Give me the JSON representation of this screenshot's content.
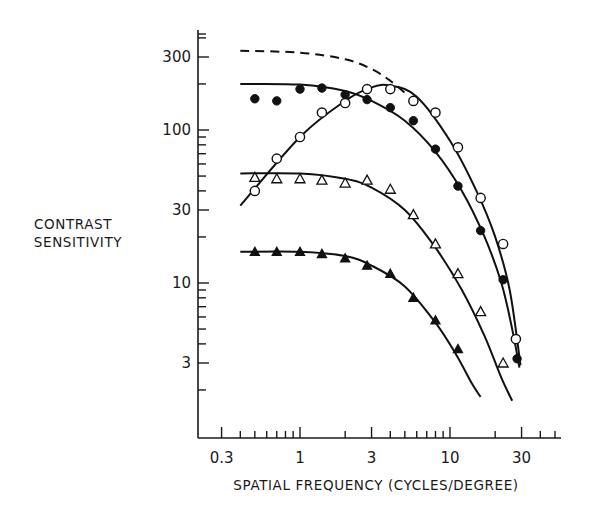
{
  "chart_data": {
    "type": "line",
    "title": "",
    "xlabel": "SPATIAL FREQUENCY (CYCLES/DEGREE)",
    "ylabel": [
      "CONTRAST",
      "SENSITIVITY"
    ],
    "xscale": "log",
    "yscale": "log",
    "xlim": [
      0.25,
      40
    ],
    "ylim": [
      1.6,
      450
    ],
    "xticks": [
      0.3,
      1,
      3,
      10,
      30
    ],
    "xtick_labels": [
      "0.3",
      "1",
      "3",
      "10",
      "30"
    ],
    "yticks": [
      3,
      10,
      30,
      100,
      300
    ],
    "ytick_labels": [
      "3",
      "10",
      "30",
      "100",
      "300"
    ],
    "grid": false,
    "legend": null,
    "series": [
      {
        "name": "dashed envelope",
        "marker": "none",
        "line": "dashed",
        "curve": [
          [
            0.4,
            330
          ],
          [
            1,
            320
          ],
          [
            2,
            290
          ],
          [
            3,
            250
          ],
          [
            4,
            210
          ],
          [
            5,
            175
          ]
        ]
      },
      {
        "name": "filled circles",
        "marker": "filled-circle",
        "points": [
          [
            0.5,
            160
          ],
          [
            0.7,
            155
          ],
          [
            1,
            185
          ],
          [
            1.4,
            188
          ],
          [
            2,
            170
          ],
          [
            2.8,
            158
          ],
          [
            4,
            140
          ],
          [
            5.7,
            115
          ],
          [
            8,
            75
          ],
          [
            11.3,
            43
          ],
          [
            16,
            22
          ],
          [
            22.6,
            10.5
          ],
          [
            28,
            3.2
          ]
        ],
        "curve": [
          [
            0.4,
            200
          ],
          [
            1,
            198
          ],
          [
            2,
            180
          ],
          [
            3,
            155
          ],
          [
            5,
            115
          ],
          [
            8,
            72
          ],
          [
            12,
            40
          ],
          [
            17,
            20
          ],
          [
            22,
            10
          ],
          [
            26,
            5
          ],
          [
            29,
            2.8
          ]
        ]
      },
      {
        "name": "open circles",
        "marker": "open-circle",
        "points": [
          [
            0.5,
            40
          ],
          [
            0.7,
            65
          ],
          [
            1,
            90
          ],
          [
            1.4,
            130
          ],
          [
            2,
            150
          ],
          [
            2.8,
            185
          ],
          [
            4,
            185
          ],
          [
            5.7,
            155
          ],
          [
            8,
            130
          ],
          [
            11.3,
            77
          ],
          [
            16,
            36
          ],
          [
            22.6,
            18
          ],
          [
            27.5,
            4.3
          ]
        ],
        "curve": [
          [
            0.4,
            32
          ],
          [
            1,
            90
          ],
          [
            2,
            155
          ],
          [
            3,
            190
          ],
          [
            4,
            195
          ],
          [
            6,
            165
          ],
          [
            10,
            85
          ],
          [
            15,
            40
          ],
          [
            20,
            20
          ],
          [
            25,
            9
          ],
          [
            29.5,
            2.9
          ]
        ]
      },
      {
        "name": "open triangles",
        "marker": "open-triangle",
        "points": [
          [
            0.5,
            49
          ],
          [
            0.7,
            48
          ],
          [
            1,
            48
          ],
          [
            1.4,
            47
          ],
          [
            2,
            45
          ],
          [
            2.8,
            47
          ],
          [
            4,
            41
          ],
          [
            5.7,
            28
          ],
          [
            8,
            18
          ],
          [
            11.3,
            11.5
          ],
          [
            16,
            6.5
          ],
          [
            22.6,
            3
          ]
        ],
        "curve": [
          [
            0.4,
            52
          ],
          [
            1,
            52
          ],
          [
            2,
            48
          ],
          [
            3,
            42
          ],
          [
            5,
            30
          ],
          [
            8,
            17
          ],
          [
            12,
            9
          ],
          [
            17,
            4.5
          ],
          [
            22,
            2.4
          ],
          [
            26,
            1.7
          ]
        ]
      },
      {
        "name": "filled triangles",
        "marker": "filled-triangle",
        "points": [
          [
            0.5,
            16
          ],
          [
            0.7,
            16
          ],
          [
            1,
            16
          ],
          [
            1.4,
            15.5
          ],
          [
            2,
            14.5
          ],
          [
            2.8,
            13
          ],
          [
            4,
            11.5
          ],
          [
            5.7,
            8
          ],
          [
            8,
            5.7
          ],
          [
            11.3,
            3.7
          ]
        ],
        "curve": [
          [
            0.4,
            16
          ],
          [
            1,
            16
          ],
          [
            2,
            15
          ],
          [
            3,
            13
          ],
          [
            5,
            9.5
          ],
          [
            8,
            5.5
          ],
          [
            11,
            3.4
          ],
          [
            14,
            2.2
          ],
          [
            16,
            1.8
          ]
        ]
      }
    ]
  }
}
